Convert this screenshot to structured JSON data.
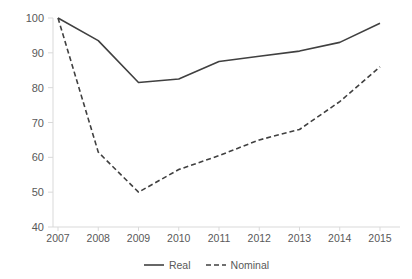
{
  "chart_data": {
    "type": "line",
    "title": "",
    "xlabel": "",
    "ylabel": "",
    "categories": [
      "2007",
      "2008",
      "2009",
      "2010",
      "2011",
      "2012",
      "2013",
      "2014",
      "2015"
    ],
    "x": [
      2007,
      2008,
      2009,
      2010,
      2011,
      2012,
      2013,
      2014,
      2015
    ],
    "xlim": [
      2007,
      2015
    ],
    "ylim": [
      40,
      100
    ],
    "yticks": [
      40,
      50,
      60,
      70,
      80,
      90,
      100
    ],
    "ytick_labels": [
      "40",
      "50",
      "60",
      "70",
      "80",
      "90",
      "100"
    ],
    "grid": false,
    "legend_position": "bottom-center",
    "series": [
      {
        "name": "Real",
        "style": "solid",
        "color": "#404040",
        "values": [
          100,
          93.5,
          81.5,
          82.5,
          87.5,
          89,
          90.5,
          93,
          98.5
        ]
      },
      {
        "name": "Nominal",
        "style": "dashed",
        "color": "#404040",
        "values": [
          100,
          61.5,
          50,
          56.5,
          60.5,
          65,
          68,
          76,
          86
        ]
      }
    ]
  },
  "axes": {
    "axis_color": "#d9d9d9",
    "tick_color": "#d9d9d9",
    "label_color": "#595959"
  },
  "legend": {
    "entries": [
      {
        "label": "Real",
        "style": "solid"
      },
      {
        "label": "Nominal",
        "style": "dashed"
      }
    ]
  }
}
